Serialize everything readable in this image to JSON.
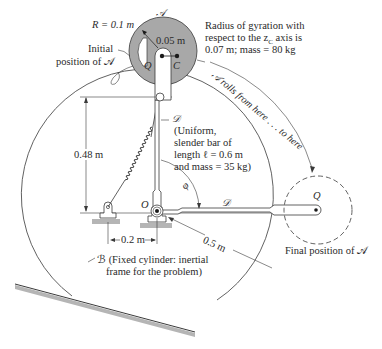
{
  "figure": {
    "labels": {
      "radius": "R = 0.1 m",
      "body_A_top": "𝒜",
      "offset": "0.05 m",
      "point_Q": "Q",
      "point_C": "C",
      "initial_position_line1": "Initial",
      "initial_position_line2": "position of 𝒜",
      "gyration_line1": "Radius of gyration with",
      "gyration_line2": "respect to the z",
      "gyration_sub": "C",
      "gyration_line2_end": " axis is",
      "gyration_line3": "0.07 m; mass = 80 kg",
      "rolls_text": "𝒜 rolls from here . . . to here",
      "bar_D": "𝒟",
      "bar_desc_line1": "(Uniform,",
      "bar_desc_line2": "slender bar of",
      "bar_desc_line3": "length ℓ = 0.6 m",
      "bar_desc_line4": "and mass = 35 kg)",
      "height_dim": "0.48 m",
      "point_O": "O",
      "angle": "φ",
      "bar_D_horizontal": "𝒟",
      "point_Q_final": "Q",
      "spacing_dim": "0.2 m",
      "radius_B_dim": "0.5 m",
      "final_position": "Final position of 𝒜",
      "cylinder_B_line1": "ℬ (Fixed cylinder: inertial",
      "cylinder_B_line2": "frame for the problem)"
    },
    "colors": {
      "disk_fill": "#a8a8a8",
      "line": "#3a3a3a",
      "ground_shade": "#b5b5b5"
    }
  }
}
